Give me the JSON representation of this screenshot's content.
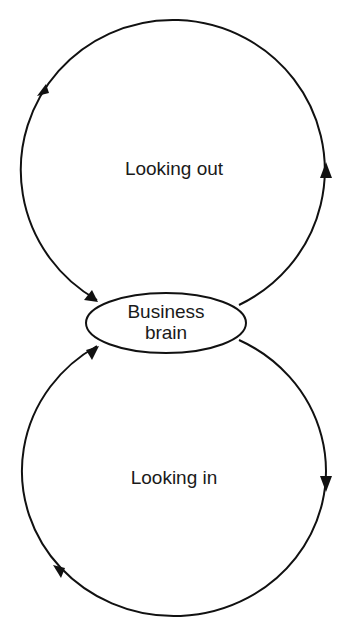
{
  "diagram": {
    "type": "two-loop cycle diagram",
    "center_node": {
      "label_line1": "Business",
      "label_line2": "brain"
    },
    "loops": [
      {
        "id": "top",
        "label": "Looking out",
        "direction": "counter-clockwise"
      },
      {
        "id": "bottom",
        "label": "Looking in",
        "direction": "clockwise"
      }
    ],
    "colors": {
      "stroke": "#111111",
      "text": "#1a1a1a",
      "background": "#ffffff"
    }
  }
}
